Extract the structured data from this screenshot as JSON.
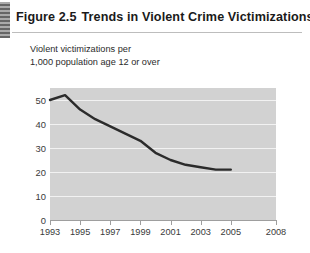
{
  "figure": {
    "number": "Figure 2.5",
    "title": "Trends in Violent Crime Victimizations",
    "subtitle": "Violent victimizations per\n1,000 population age 12 or over"
  },
  "colors": {
    "plot_background": "#d2d2d2",
    "gridline": "#f2f2f2",
    "series_line": "#2b2b2b",
    "axis": "#9e9e9e",
    "text": "#2b2b2b"
  },
  "chart_data": {
    "type": "line",
    "title": "Trends in Violent Crime Victimizations",
    "subtitle": "Violent victimizations per 1,000 population age 12 or over",
    "xlabel": "",
    "ylabel": "Violent victimizations per 1,000 population age 12 or over",
    "xlim": [
      1993,
      2008
    ],
    "ylim": [
      0,
      55
    ],
    "yticks": [
      0,
      10,
      20,
      30,
      40,
      50
    ],
    "ytick_labels": [
      "0",
      "10",
      "20",
      "30",
      "40",
      "50"
    ],
    "xticks": [
      1993,
      1995,
      1997,
      1999,
      2001,
      2003,
      2005,
      2008
    ],
    "xtick_labels": [
      "1993",
      "1995",
      "1997",
      "1999",
      "2001",
      "2003",
      "2005",
      "2008"
    ],
    "grid": true,
    "grid_axis": "y",
    "legend": false,
    "series": [
      {
        "name": "Violent victimization rate",
        "x": [
          1993,
          1994,
          1995,
          1996,
          1997,
          1998,
          1999,
          2000,
          2001,
          2002,
          2003,
          2004,
          2005
        ],
        "values": [
          50,
          52,
          46,
          42,
          39,
          36,
          33,
          28,
          25,
          23,
          22,
          21,
          21
        ]
      }
    ]
  }
}
